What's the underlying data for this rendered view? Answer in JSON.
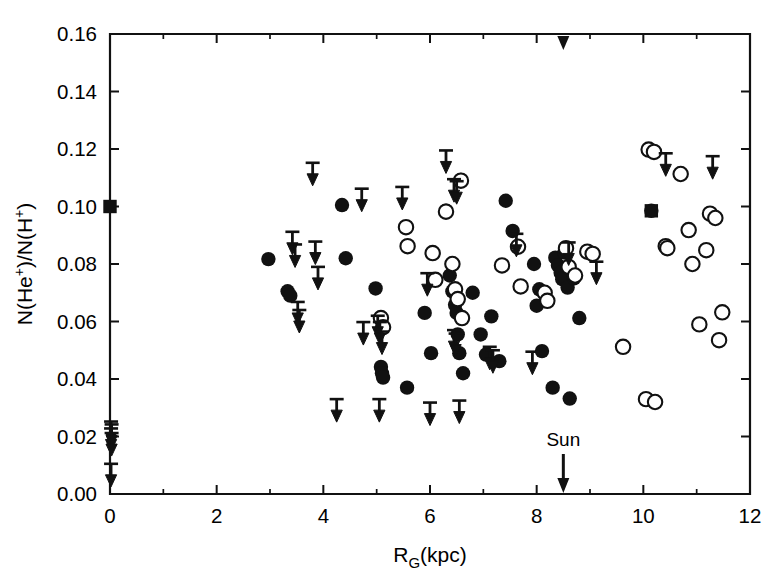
{
  "figure": {
    "width": 780,
    "height": 582,
    "background": "#ffffff",
    "ink_color": "#111111"
  },
  "chart_data": {
    "type": "scatter",
    "title": "",
    "subtitle": "",
    "xlabel": "R_G(kpc)",
    "xlabel_parts": {
      "base": "R",
      "sub": "G",
      "tail": "(kpc)"
    },
    "ylabel": "N(He+)/N(H+)",
    "ylabel_parts": {
      "p1": "N(He",
      "sup1": "+",
      "p2": ")/N(H",
      "sup2": "+",
      "p3": ")"
    },
    "xlim": [
      0,
      12
    ],
    "ylim": [
      0.0,
      0.16
    ],
    "grid": false,
    "legend": null,
    "x_ticks": [
      0,
      2,
      4,
      6,
      8,
      10,
      12
    ],
    "x_ticklabels": [
      "0",
      "2",
      "4",
      "6",
      "8",
      "10",
      "12"
    ],
    "x_minor_ticks": [
      1,
      3,
      5,
      7,
      9,
      11
    ],
    "y_ticks": [
      0.0,
      0.02,
      0.04,
      0.06,
      0.08,
      0.1,
      0.12,
      0.14,
      0.16
    ],
    "y_ticklabels": [
      "0.00",
      "0.02",
      "0.04",
      "0.06",
      "0.08",
      "0.10",
      "0.12",
      "0.14",
      "0.16"
    ],
    "annotations": [
      {
        "name": "sun-marker",
        "text": "Sun",
        "x": 8.5,
        "y": 0.0,
        "kind": "down-arrow-label"
      }
    ],
    "series": [
      {
        "name": "filled-circles",
        "marker": "filled-circle",
        "points": [
          [
            2.97,
            0.0817
          ],
          [
            3.33,
            0.0705
          ],
          [
            3.38,
            0.069
          ],
          [
            4.35,
            0.1005
          ],
          [
            4.42,
            0.082
          ],
          [
            4.98,
            0.0715
          ],
          [
            5.08,
            0.0442
          ],
          [
            5.1,
            0.042
          ],
          [
            5.12,
            0.0405
          ],
          [
            5.57,
            0.037
          ],
          [
            5.9,
            0.063
          ],
          [
            6.02,
            0.049
          ],
          [
            6.3,
            0.0985
          ],
          [
            6.37,
            0.076
          ],
          [
            6.42,
            0.0705
          ],
          [
            6.47,
            0.0658
          ],
          [
            6.5,
            0.063
          ],
          [
            6.52,
            0.0555
          ],
          [
            6.55,
            0.049
          ],
          [
            6.58,
            0.1092
          ],
          [
            6.62,
            0.042
          ],
          [
            6.8,
            0.07
          ],
          [
            6.95,
            0.0555
          ],
          [
            7.05,
            0.0485
          ],
          [
            7.15,
            0.0618
          ],
          [
            7.3,
            0.0462
          ],
          [
            7.42,
            0.102
          ],
          [
            7.55,
            0.0915
          ],
          [
            7.95,
            0.08
          ],
          [
            8.0,
            0.0655
          ],
          [
            8.05,
            0.0712
          ],
          [
            8.1,
            0.0497
          ],
          [
            8.35,
            0.0822
          ],
          [
            8.4,
            0.0795
          ],
          [
            8.45,
            0.077
          ],
          [
            8.48,
            0.0747
          ],
          [
            8.52,
            0.084
          ],
          [
            8.58,
            0.0718
          ],
          [
            8.7,
            0.075
          ],
          [
            8.8,
            0.0612
          ],
          [
            8.3,
            0.037
          ],
          [
            8.62,
            0.0332
          ],
          [
            10.15,
            0.0985
          ]
        ]
      },
      {
        "name": "open-circles",
        "marker": "open-circle",
        "points": [
          [
            5.08,
            0.0612
          ],
          [
            5.12,
            0.058
          ],
          [
            5.55,
            0.0928
          ],
          [
            5.58,
            0.0862
          ],
          [
            6.05,
            0.0838
          ],
          [
            6.1,
            0.0745
          ],
          [
            6.3,
            0.0982
          ],
          [
            6.42,
            0.08
          ],
          [
            6.47,
            0.0712
          ],
          [
            6.52,
            0.0678
          ],
          [
            6.58,
            0.109
          ],
          [
            6.6,
            0.0612
          ],
          [
            7.35,
            0.0795
          ],
          [
            7.65,
            0.086
          ],
          [
            7.7,
            0.0722
          ],
          [
            8.15,
            0.07
          ],
          [
            8.2,
            0.0672
          ],
          [
            8.55,
            0.0855
          ],
          [
            8.6,
            0.079
          ],
          [
            8.72,
            0.076
          ],
          [
            8.95,
            0.0843
          ],
          [
            9.05,
            0.0835
          ],
          [
            9.62,
            0.0512
          ],
          [
            10.1,
            0.1198
          ],
          [
            10.2,
            0.119
          ],
          [
            10.05,
            0.033
          ],
          [
            10.22,
            0.032
          ],
          [
            10.42,
            0.0862
          ],
          [
            10.45,
            0.0855
          ],
          [
            10.7,
            0.1113
          ],
          [
            10.85,
            0.0918
          ],
          [
            10.92,
            0.08
          ],
          [
            11.05,
            0.059
          ],
          [
            11.18,
            0.0848
          ],
          [
            11.25,
            0.0975
          ],
          [
            11.35,
            0.096
          ],
          [
            11.42,
            0.0535
          ],
          [
            11.48,
            0.0632
          ]
        ]
      },
      {
        "name": "filled-squares",
        "marker": "filled-square",
        "points": [
          [
            0.0,
            0.1
          ],
          [
            10.15,
            0.0985
          ]
        ]
      }
    ],
    "upper_limits": {
      "name": "upper-limit-arrows",
      "marker": "down-arrow-with-cap",
      "description": "Downward arrows denote upper limits on N(He+)/N(H+)",
      "points": [
        [
          0.02,
          0.0252
        ],
        [
          0.03,
          0.0242
        ],
        [
          0.02,
          0.0228
        ],
        [
          0.03,
          0.0212
        ],
        [
          0.02,
          0.0105
        ],
        [
          3.42,
          0.0912
        ],
        [
          3.47,
          0.0868
        ],
        [
          3.52,
          0.0668
        ],
        [
          3.55,
          0.064
        ],
        [
          3.8,
          0.1152
        ],
        [
          3.85,
          0.0878
        ],
        [
          3.9,
          0.079
        ],
        [
          4.25,
          0.033
        ],
        [
          4.72,
          0.1062
        ],
        [
          4.75,
          0.0598
        ],
        [
          5.02,
          0.062
        ],
        [
          5.06,
          0.0598
        ],
        [
          5.1,
          0.0565
        ],
        [
          5.05,
          0.033
        ],
        [
          5.48,
          0.1068
        ],
        [
          5.95,
          0.0768
        ],
        [
          6.0,
          0.0318
        ],
        [
          6.3,
          0.1195
        ],
        [
          6.45,
          0.1095
        ],
        [
          6.5,
          0.1088
        ],
        [
          6.45,
          0.057
        ],
        [
          6.48,
          0.0558
        ],
        [
          6.55,
          0.0325
        ],
        [
          7.12,
          0.0512
        ],
        [
          7.18,
          0.05
        ],
        [
          7.62,
          0.0905
        ],
        [
          7.92,
          0.0495
        ],
        [
          8.6,
          0.0875
        ],
        [
          9.12,
          0.0808
        ],
        [
          10.42,
          0.1185
        ],
        [
          11.3,
          0.1175
        ]
      ]
    }
  }
}
